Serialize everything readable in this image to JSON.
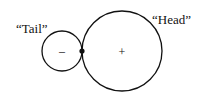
{
  "diagram": {
    "labels": {
      "tail": "“Tail”",
      "head": "“Head”"
    },
    "signs": {
      "small_circle": "–",
      "large_circle": "+"
    },
    "colors": {
      "stroke": "#111111",
      "background": "#ffffff"
    }
  }
}
